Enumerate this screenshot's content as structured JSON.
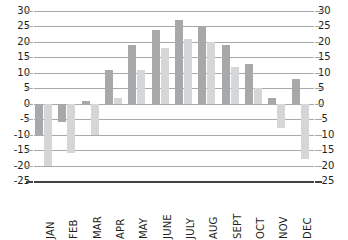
{
  "chart_data": {
    "type": "bar",
    "title": "",
    "subtitle": "",
    "xlabel": "",
    "ylabel": "",
    "ylim": [
      -25,
      30
    ],
    "ytick_step": 5,
    "yticks": [
      30,
      25,
      20,
      15,
      10,
      5,
      0,
      -5,
      -10,
      -15,
      -20,
      -25
    ],
    "ytick_labels": [
      "30",
      "25",
      "20",
      "15",
      "10",
      "5",
      "0",
      "-5",
      "-10",
      "-15",
      "-20",
      "-25"
    ],
    "grid": true,
    "grid_axis": "y",
    "legend": false,
    "legend_position": "none",
    "dual_y_axis": true,
    "categories": [
      "JAN",
      "FEB",
      "MAR",
      "APR",
      "MAY",
      "JUNE",
      "JULY",
      "AUG",
      "SEPT",
      "OCT",
      "NOV",
      "DEC"
    ],
    "series": [
      {
        "name": "series-1",
        "color": "#a6a8aa",
        "values": [
          -10,
          -6,
          1,
          11,
          19,
          24,
          27,
          25,
          19,
          13,
          2,
          8
        ]
      },
      {
        "name": "series-2",
        "color": "#d5d6d8",
        "values": [
          -20,
          -16,
          -10,
          2,
          11,
          18,
          21,
          20,
          12,
          5,
          -8,
          -18
        ]
      }
    ]
  },
  "axis": {
    "left_tick_labels": [
      "30",
      "25",
      "20",
      "15",
      "10",
      "5",
      "0",
      "-5",
      "-10",
      "-15",
      "-20",
      "-25"
    ],
    "right_tick_labels": [
      "30",
      "25",
      "20",
      "15",
      "10",
      "5",
      "0",
      "-5",
      "-10",
      "-15",
      "-20",
      "-25"
    ]
  },
  "colors": {
    "series_1": "#a6a8aa",
    "series_2": "#d5d6d8",
    "gridline": "#a7a9ac",
    "baseline": "#414042",
    "text": "#231f20",
    "background": "#ffffff"
  }
}
